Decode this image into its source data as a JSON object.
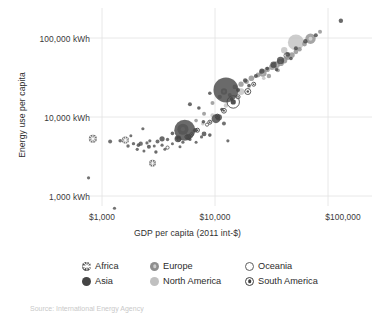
{
  "chart_data": {
    "type": "scatter",
    "title": "",
    "subtitle": "",
    "xlabel": "GDP per capita (2011 int-$)",
    "ylabel": "Energy use per capita",
    "xscale": "log",
    "yscale": "log",
    "xlim": [
      700,
      160000
    ],
    "ylim": [
      500,
      200000
    ],
    "xticks": [
      1000,
      10000,
      100000
    ],
    "xticklabels": [
      "$1,000",
      "$10,000",
      "$100,000"
    ],
    "yticks": [
      1000,
      10000,
      100000
    ],
    "yticklabels": [
      "1,000 kWh",
      "10,000 kWh",
      "100,000 kWh"
    ],
    "grid": true,
    "grid_color": "#e2e2e2",
    "legend_position": "bottom",
    "size_encoding": "population",
    "legend": [
      {
        "name": "Africa",
        "marker": "circle-asterisk",
        "color": "#4a4a4a"
      },
      {
        "name": "Asia",
        "marker": "circle-filled",
        "color": "#454545"
      },
      {
        "name": "Europe",
        "marker": "circle-filled-mid",
        "color": "#8e8e8e"
      },
      {
        "name": "North America",
        "marker": "circle-filled-light",
        "color": "#c0c0c0"
      },
      {
        "name": "Oceania",
        "marker": "circle-open",
        "color": "#ffffff"
      },
      {
        "name": "South America",
        "marker": "circle-dot",
        "color": "#3f3f3f"
      }
    ],
    "series": [
      {
        "name": "Africa",
        "color": "#4a4a4a",
        "points": [
          {
            "x": 830,
            "y": 5300,
            "r": 4.0
          },
          {
            "x": 760,
            "y": 1700,
            "r": 1.6
          },
          {
            "x": 1180,
            "y": 4900,
            "r": 2.0
          },
          {
            "x": 1290,
            "y": 700,
            "r": 1.6
          },
          {
            "x": 1450,
            "y": 5000,
            "r": 1.8
          },
          {
            "x": 1610,
            "y": 5100,
            "r": 3.6
          },
          {
            "x": 1700,
            "y": 4300,
            "r": 1.7
          },
          {
            "x": 1900,
            "y": 4600,
            "r": 1.7
          },
          {
            "x": 2050,
            "y": 3900,
            "r": 1.6
          },
          {
            "x": 2200,
            "y": 4600,
            "r": 2.2
          },
          {
            "x": 2350,
            "y": 3700,
            "r": 1.5
          },
          {
            "x": 2500,
            "y": 4700,
            "r": 1.6
          },
          {
            "x": 2650,
            "y": 5000,
            "r": 1.6
          },
          {
            "x": 2800,
            "y": 2600,
            "r": 3.4
          },
          {
            "x": 2900,
            "y": 4300,
            "r": 1.5
          },
          {
            "x": 3100,
            "y": 4900,
            "r": 2.0
          },
          {
            "x": 3400,
            "y": 4400,
            "r": 1.6
          },
          {
            "x": 3600,
            "y": 3900,
            "r": 1.5
          },
          {
            "x": 3800,
            "y": 5200,
            "r": 1.7
          },
          {
            "x": 4200,
            "y": 4600,
            "r": 1.5
          },
          {
            "x": 4600,
            "y": 5400,
            "r": 1.6
          },
          {
            "x": 5200,
            "y": 4800,
            "r": 1.6
          },
          {
            "x": 6000,
            "y": 5200,
            "r": 1.6
          },
          {
            "x": 6800,
            "y": 4800,
            "r": 1.5
          },
          {
            "x": 7600,
            "y": 5600,
            "r": 1.6
          },
          {
            "x": 12000,
            "y": 8300,
            "r": 2.0
          },
          {
            "x": 13000,
            "y": 5000,
            "r": 1.6
          },
          {
            "x": 2300,
            "y": 7100,
            "r": 1.6
          },
          {
            "x": 1800,
            "y": 5800,
            "r": 1.5
          },
          {
            "x": 4900,
            "y": 4200,
            "r": 1.5
          }
        ]
      },
      {
        "name": "Asia",
        "color": "#454545",
        "points": [
          {
            "x": 5400,
            "y": 6800,
            "r": 10.5
          },
          {
            "x": 12500,
            "y": 22000,
            "r": 12.5
          },
          {
            "x": 4700,
            "y": 5300,
            "r": 3.4
          },
          {
            "x": 5800,
            "y": 5600,
            "r": 3.0
          },
          {
            "x": 3400,
            "y": 5300,
            "r": 2.6
          },
          {
            "x": 6700,
            "y": 6800,
            "r": 2.2
          },
          {
            "x": 8000,
            "y": 6100,
            "r": 2.4
          },
          {
            "x": 9000,
            "y": 5900,
            "r": 1.8
          },
          {
            "x": 10200,
            "y": 9500,
            "r": 4.4
          },
          {
            "x": 10800,
            "y": 9900,
            "r": 3.2
          },
          {
            "x": 7200,
            "y": 13000,
            "r": 1.8
          },
          {
            "x": 6000,
            "y": 14500,
            "r": 2.0
          },
          {
            "x": 9000,
            "y": 20000,
            "r": 1.8
          },
          {
            "x": 16000,
            "y": 22000,
            "r": 2.0
          },
          {
            "x": 18500,
            "y": 29000,
            "r": 2.2
          },
          {
            "x": 23000,
            "y": 33000,
            "r": 2.0
          },
          {
            "x": 26000,
            "y": 38000,
            "r": 2.6
          },
          {
            "x": 33000,
            "y": 46000,
            "r": 3.2
          },
          {
            "x": 38000,
            "y": 52000,
            "r": 3.6
          },
          {
            "x": 44000,
            "y": 62000,
            "r": 2.4
          },
          {
            "x": 52000,
            "y": 74000,
            "r": 2.0
          },
          {
            "x": 63000,
            "y": 91000,
            "r": 2.2
          },
          {
            "x": 78000,
            "y": 108000,
            "r": 2.0
          },
          {
            "x": 130000,
            "y": 165000,
            "r": 2.2
          },
          {
            "x": 2600,
            "y": 4200,
            "r": 2.0
          },
          {
            "x": 3000,
            "y": 3600,
            "r": 1.7
          },
          {
            "x": 2100,
            "y": 4400,
            "r": 1.8
          },
          {
            "x": 14000,
            "y": 17000,
            "r": 1.8
          },
          {
            "x": 20000,
            "y": 25000,
            "r": 1.8
          },
          {
            "x": 29000,
            "y": 41000,
            "r": 1.8
          },
          {
            "x": 4200,
            "y": 6200,
            "r": 1.8
          },
          {
            "x": 7900,
            "y": 8700,
            "r": 1.8
          },
          {
            "x": 11500,
            "y": 12500,
            "r": 1.7
          },
          {
            "x": 35000,
            "y": 40000,
            "r": 1.8
          },
          {
            "x": 47000,
            "y": 55000,
            "r": 1.8
          }
        ]
      },
      {
        "name": "Europe",
        "color": "#8e8e8e",
        "points": [
          {
            "x": 5200,
            "y": 7000,
            "r": 5.6
          },
          {
            "x": 12000,
            "y": 21000,
            "r": 3.2
          },
          {
            "x": 15000,
            "y": 24000,
            "r": 2.4
          },
          {
            "x": 17000,
            "y": 26000,
            "r": 2.6
          },
          {
            "x": 19000,
            "y": 28000,
            "r": 2.4
          },
          {
            "x": 21000,
            "y": 31000,
            "r": 2.8
          },
          {
            "x": 24000,
            "y": 34000,
            "r": 2.4
          },
          {
            "x": 26500,
            "y": 36000,
            "r": 3.8
          },
          {
            "x": 29000,
            "y": 40000,
            "r": 2.6
          },
          {
            "x": 32000,
            "y": 43000,
            "r": 3.0
          },
          {
            "x": 35000,
            "y": 46000,
            "r": 3.4
          },
          {
            "x": 38000,
            "y": 49000,
            "r": 3.6
          },
          {
            "x": 41000,
            "y": 52000,
            "r": 3.0
          },
          {
            "x": 44000,
            "y": 57000,
            "r": 2.6
          },
          {
            "x": 48000,
            "y": 61000,
            "r": 2.8
          },
          {
            "x": 52000,
            "y": 67000,
            "r": 2.4
          },
          {
            "x": 56000,
            "y": 72000,
            "r": 2.2
          },
          {
            "x": 62000,
            "y": 84000,
            "r": 2.4
          },
          {
            "x": 70000,
            "y": 98000,
            "r": 5.2
          },
          {
            "x": 85000,
            "y": 120000,
            "r": 2.0
          },
          {
            "x": 9500,
            "y": 15000,
            "r": 2.0
          },
          {
            "x": 11000,
            "y": 18000,
            "r": 2.2
          },
          {
            "x": 8000,
            "y": 11000,
            "r": 2.0
          },
          {
            "x": 13500,
            "y": 19000,
            "r": 2.0
          },
          {
            "x": 6800,
            "y": 9000,
            "r": 1.8
          },
          {
            "x": 30000,
            "y": 33000,
            "r": 2.2
          },
          {
            "x": 36000,
            "y": 39000,
            "r": 2.0
          }
        ]
      },
      {
        "name": "North America",
        "color": "#c0c0c0",
        "points": [
          {
            "x": 52000,
            "y": 88000,
            "r": 8.0
          },
          {
            "x": 41000,
            "y": 70000,
            "r": 3.2
          },
          {
            "x": 17000,
            "y": 21000,
            "r": 3.4
          },
          {
            "x": 12500,
            "y": 14000,
            "r": 2.2
          },
          {
            "x": 9500,
            "y": 10500,
            "r": 2.0
          },
          {
            "x": 7800,
            "y": 8200,
            "r": 1.8
          },
          {
            "x": 6400,
            "y": 6600,
            "r": 1.8
          },
          {
            "x": 14500,
            "y": 16000,
            "r": 1.8
          },
          {
            "x": 20000,
            "y": 24000,
            "r": 1.8
          },
          {
            "x": 27000,
            "y": 31000,
            "r": 1.8
          }
        ]
      },
      {
        "name": "Oceania",
        "color": "#ffffff",
        "points": [
          {
            "x": 43000,
            "y": 60000,
            "r": 2.6
          },
          {
            "x": 33000,
            "y": 45000,
            "r": 2.2
          },
          {
            "x": 5600,
            "y": 5600,
            "r": 1.8
          },
          {
            "x": 3800,
            "y": 4100,
            "r": 1.6
          },
          {
            "x": 8500,
            "y": 8000,
            "r": 1.6
          }
        ]
      },
      {
        "name": "South America",
        "color": "#3f3f3f",
        "points": [
          {
            "x": 14500,
            "y": 15500,
            "r": 6.2
          },
          {
            "x": 19500,
            "y": 21000,
            "r": 3.0
          },
          {
            "x": 12000,
            "y": 12000,
            "r": 2.4
          },
          {
            "x": 10500,
            "y": 10200,
            "r": 2.2
          },
          {
            "x": 9000,
            "y": 8600,
            "r": 2.0
          },
          {
            "x": 7000,
            "y": 6800,
            "r": 2.0
          },
          {
            "x": 6200,
            "y": 6000,
            "r": 1.8
          },
          {
            "x": 16000,
            "y": 18000,
            "r": 2.0
          },
          {
            "x": 22000,
            "y": 26000,
            "r": 2.0
          },
          {
            "x": 4800,
            "y": 5200,
            "r": 1.8
          }
        ]
      }
    ]
  },
  "axis": {
    "y_ticks": [
      {
        "label": "100,000 kWh",
        "value": 100000
      },
      {
        "label": "10,000 kWh",
        "value": 10000
      },
      {
        "label": "1,000 kWh",
        "value": 1000
      }
    ],
    "x_ticks": [
      {
        "label": "$1,000",
        "value": 1000
      },
      {
        "label": "$10,000",
        "value": 10000
      },
      {
        "label": "$100,000",
        "value": 100000
      }
    ],
    "x_title": "GDP per capita (2011 int-$)",
    "y_title": "Energy use per capita"
  },
  "legend": {
    "items": [
      {
        "label": "Africa"
      },
      {
        "label": "Europe"
      },
      {
        "label": "Oceania"
      },
      {
        "label": "Asia"
      },
      {
        "label": "North America"
      },
      {
        "label": "South America"
      }
    ]
  },
  "footer": {
    "caption": "Source: International Energy Agency"
  }
}
